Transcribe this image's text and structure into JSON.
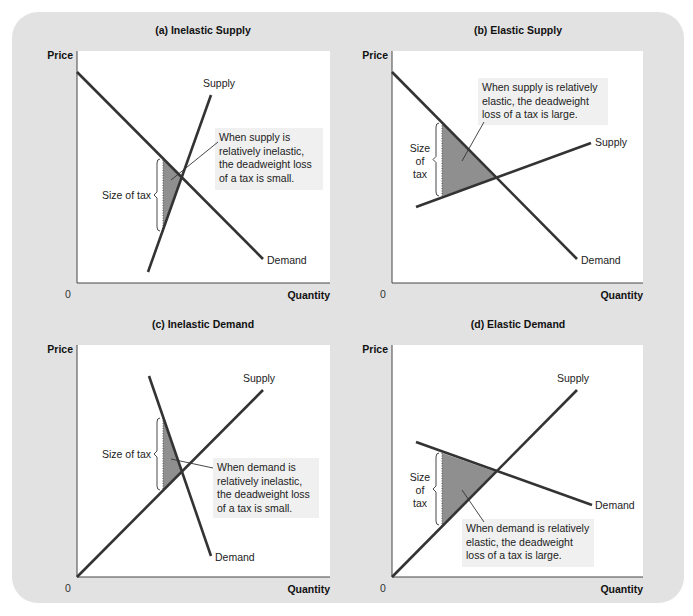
{
  "figure": {
    "background_color": "#e2e2e2",
    "plot_color": "#ffffff",
    "line_color": "#333333",
    "dwl_fill": "#8f8f8f",
    "note_bg": "#f0f0f0"
  },
  "chart_data": [
    {
      "type": "line",
      "panel": "a",
      "title": "(a) Inelastic Supply",
      "xlabel": "Quantity",
      "ylabel": "Price",
      "origin_label": "0",
      "grid": false,
      "series": [
        {
          "name": "Supply",
          "label": "Supply",
          "points": [
            [
              148,
              272
            ],
            [
              211,
              95
            ]
          ]
        },
        {
          "name": "Demand",
          "label": "Demand",
          "points": [
            [
              77,
              72
            ],
            [
              263,
              259
            ]
          ]
        }
      ],
      "deadweight_loss": [
        [
          163,
          160
        ],
        [
          182,
          178
        ],
        [
          163,
          231
        ]
      ],
      "tax_label": [
        "Size of tax"
      ],
      "tax_bracket": {
        "x": 157,
        "y1": 159,
        "y2": 231
      },
      "annotation": [
        "When supply is",
        "relatively inelastic,",
        "the deadweight loss",
        "of a tax is small."
      ],
      "annotation_box": {
        "x": 215,
        "y": 128,
        "w": 108,
        "h": 62
      },
      "leader": [
        [
          171,
          180
        ],
        [
          218,
          142
        ]
      ]
    },
    {
      "type": "line",
      "panel": "b",
      "title": "(b) Elastic Supply",
      "xlabel": "Quantity",
      "ylabel": "Price",
      "origin_label": "0",
      "grid": false,
      "series": [
        {
          "name": "Supply",
          "label": "Supply",
          "points": [
            [
              416,
              207
            ],
            [
              591,
              143
            ]
          ]
        },
        {
          "name": "Demand",
          "label": "Demand",
          "points": [
            [
              392,
              72
            ],
            [
              577,
              259
            ]
          ]
        }
      ],
      "deadweight_loss": [
        [
          442,
          123
        ],
        [
          496,
          178
        ],
        [
          442,
          196
        ]
      ],
      "tax_label": [
        "Size",
        "of",
        "tax"
      ],
      "tax_bracket": {
        "x": 436,
        "y1": 123,
        "y2": 196
      },
      "annotation": [
        "When supply is relatively",
        "elastic, the deadweight",
        "loss of a tax is large."
      ],
      "annotation_box": {
        "x": 478,
        "y": 78,
        "w": 130,
        "h": 47
      },
      "leader": [
        [
          462,
          161
        ],
        [
          484,
          122
        ]
      ]
    },
    {
      "type": "line",
      "panel": "c",
      "title": "(c) Inelastic Demand",
      "xlabel": "Quantity",
      "ylabel": "Price",
      "origin_label": "0",
      "grid": false,
      "series": [
        {
          "name": "Supply",
          "label": "Supply",
          "points": [
            [
              77,
              577
            ],
            [
              263,
              390
            ]
          ]
        },
        {
          "name": "Demand",
          "label": "Demand",
          "points": [
            [
              149,
              376
            ],
            [
              211,
              556
            ]
          ]
        }
      ],
      "deadweight_loss": [
        [
          163,
          418
        ],
        [
          182,
          471
        ],
        [
          163,
          490
        ]
      ],
      "tax_label": [
        "Size of tax"
      ],
      "tax_bracket": {
        "x": 157,
        "y1": 418,
        "y2": 490
      },
      "annotation": [
        "When demand is",
        "relatively inelastic,",
        "the deadweight loss",
        "of a tax is small."
      ],
      "annotation_box": {
        "x": 213,
        "y": 458,
        "w": 106,
        "h": 60
      },
      "leader": [
        [
          171,
          459
        ],
        [
          213,
          468
        ]
      ]
    },
    {
      "type": "line",
      "panel": "d",
      "title": "(d) Elastic Demand",
      "xlabel": "Quantity",
      "ylabel": "Price",
      "origin_label": "0",
      "grid": false,
      "series": [
        {
          "name": "Supply",
          "label": "Supply",
          "points": [
            [
              392,
              577
            ],
            [
              577,
              390
            ]
          ]
        },
        {
          "name": "Demand",
          "label": "Demand",
          "points": [
            [
              416,
              442
            ],
            [
              592,
              505
            ]
          ]
        }
      ],
      "deadweight_loss": [
        [
          442,
          453
        ],
        [
          496,
          472
        ],
        [
          442,
          525
        ]
      ],
      "tax_label": [
        "Size",
        "of",
        "tax"
      ],
      "tax_bracket": {
        "x": 436,
        "y1": 453,
        "y2": 525
      },
      "annotation": [
        "When demand is relatively",
        "elastic, the deadweight",
        "loss of a tax is large."
      ],
      "annotation_box": {
        "x": 462,
        "y": 519,
        "w": 132,
        "h": 48
      },
      "leader": [
        [
          462,
          490
        ],
        [
          484,
          522
        ]
      ]
    }
  ],
  "panels_layout": [
    {
      "plot": {
        "x": 77,
        "y": 51,
        "w": 253,
        "h": 232
      },
      "title_x": 203,
      "title_y": 34
    },
    {
      "plot": {
        "x": 392,
        "y": 51,
        "w": 251,
        "h": 232
      },
      "title_x": 518,
      "title_y": 34
    },
    {
      "plot": {
        "x": 77,
        "y": 345,
        "w": 253,
        "h": 232
      },
      "title_x": 203,
      "title_y": 328
    },
    {
      "plot": {
        "x": 392,
        "y": 345,
        "w": 251,
        "h": 232
      },
      "title_x": 518,
      "title_y": 328
    }
  ]
}
